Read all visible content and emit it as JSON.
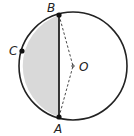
{
  "diagram": {
    "title": "",
    "type": "circle-geometry",
    "circle": {
      "cx": 73,
      "cy": 66,
      "r": 54,
      "stroke": "#222222",
      "fill": "#ffffff"
    },
    "shaded_region": {
      "description": "circular segment between chord AB and arc ACB",
      "fill": "#d9d9d9"
    },
    "points": [
      {
        "id": "B",
        "label": "B",
        "x": 59,
        "y": 15,
        "dot": true,
        "label_x": 47,
        "label_y": 12
      },
      {
        "id": "C",
        "label": "C",
        "x": 22,
        "y": 51,
        "dot": true,
        "label_x": 9,
        "label_y": 55
      },
      {
        "id": "A",
        "label": "A",
        "x": 59,
        "y": 117,
        "dot": true,
        "label_x": 54,
        "label_y": 133
      },
      {
        "id": "O",
        "label": "O",
        "x": 73,
        "y": 66,
        "dot": false,
        "label_x": 79,
        "label_y": 71
      }
    ],
    "segments": [
      {
        "from": "A",
        "to": "B",
        "style": "solid",
        "name": "chord AB"
      },
      {
        "from": "B",
        "to": "O",
        "style": "dashed",
        "name": "radius OB"
      },
      {
        "from": "A",
        "to": "O",
        "style": "dashed",
        "name": "radius OA"
      }
    ],
    "colors": {
      "stroke": "#222222",
      "shade": "#d9d9d9",
      "background": "#ffffff"
    }
  }
}
